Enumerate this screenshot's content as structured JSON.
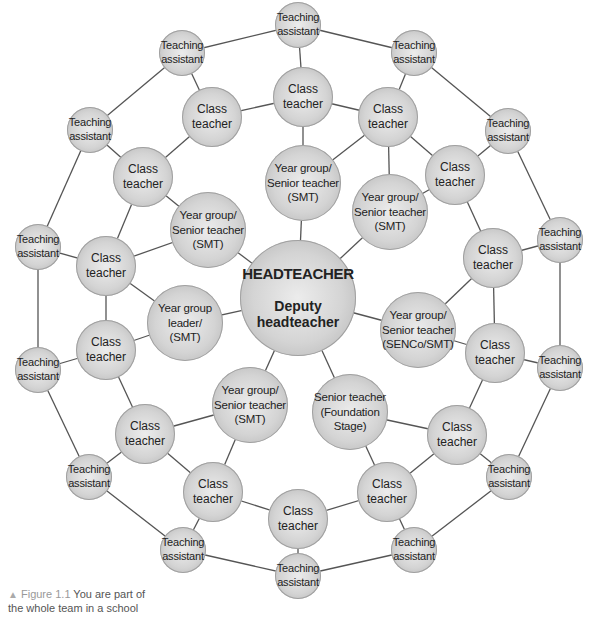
{
  "diagram": {
    "ring_color": "#555555",
    "hub": {
      "x": 298,
      "y": 298,
      "r": 58,
      "title": "HEADTEACHER",
      "subtitle": "Deputy\nheadteacher"
    },
    "inner": [
      {
        "x": 303,
        "y": 183,
        "r": 38,
        "label": "Year group/\nSenior teacher\n(SMT)"
      },
      {
        "x": 390,
        "y": 212,
        "r": 38,
        "label": "Year group/\nSenior teacher\n(SMT)"
      },
      {
        "x": 418,
        "y": 330,
        "r": 38,
        "label": "Year group/\nSenior teacher\n(SENCo/SMT)"
      },
      {
        "x": 350,
        "y": 412,
        "r": 38,
        "label": "Senior teacher\n(Foundation\nStage)"
      },
      {
        "x": 250,
        "y": 405,
        "r": 38,
        "label": "Year group/\nSenior teacher\n(SMT)"
      },
      {
        "x": 185,
        "y": 323,
        "r": 38,
        "label": "Year group\nleader/\n(SMT)"
      },
      {
        "x": 208,
        "y": 230,
        "r": 38,
        "label": "Year group/\nSenior teacher\n(SMT)"
      }
    ],
    "class_teachers": [
      {
        "x": 303,
        "y": 97,
        "label": "Class\nteacher"
      },
      {
        "x": 212,
        "y": 117,
        "label": "Class\nteacher"
      },
      {
        "x": 388,
        "y": 117,
        "label": "Class\nteacher"
      },
      {
        "x": 455,
        "y": 175,
        "label": "Class\nteacher"
      },
      {
        "x": 143,
        "y": 177,
        "label": "Class\nteacher"
      },
      {
        "x": 493,
        "y": 258,
        "label": "Class\nteacher"
      },
      {
        "x": 106,
        "y": 266,
        "label": "Class\nteacher"
      },
      {
        "x": 495,
        "y": 353,
        "label": "Class\nteacher"
      },
      {
        "x": 106,
        "y": 350,
        "label": "Class\nteacher"
      },
      {
        "x": 457,
        "y": 435,
        "label": "Class\nteacher"
      },
      {
        "x": 145,
        "y": 434,
        "label": "Class\nteacher"
      },
      {
        "x": 387,
        "y": 492,
        "label": "Class\nteacher"
      },
      {
        "x": 213,
        "y": 492,
        "label": "Class\nteacher"
      },
      {
        "x": 298,
        "y": 519,
        "label": "Class\nteacher"
      }
    ],
    "teaching_assistants": [
      {
        "x": 298,
        "y": 25,
        "label": "Teaching\nassistant"
      },
      {
        "x": 182,
        "y": 53,
        "label": "Teaching\nassistant"
      },
      {
        "x": 414,
        "y": 53,
        "label": "Teaching\nassistant"
      },
      {
        "x": 508,
        "y": 131,
        "label": "Teaching\nassistant"
      },
      {
        "x": 90,
        "y": 130,
        "label": "Teaching\nassistant"
      },
      {
        "x": 560,
        "y": 240,
        "label": "Teaching\nassistant"
      },
      {
        "x": 38,
        "y": 247,
        "label": "Teaching\nassistant"
      },
      {
        "x": 560,
        "y": 368,
        "label": "Teaching\nassistant"
      },
      {
        "x": 38,
        "y": 370,
        "label": "Teaching\nassistant"
      },
      {
        "x": 509,
        "y": 477,
        "label": "Teaching\nassistant"
      },
      {
        "x": 89,
        "y": 477,
        "label": "Teaching\nassistant"
      },
      {
        "x": 183,
        "y": 550,
        "label": "Teaching\nassistant"
      },
      {
        "x": 414,
        "y": 550,
        "label": "Teaching\nassistant"
      },
      {
        "x": 298,
        "y": 576,
        "label": "Teaching\nassistant"
      }
    ]
  },
  "caption": {
    "icon": "triangle-up-icon",
    "figure_label": "Figure 1.1",
    "text": " You are part of the whole team in a school"
  }
}
